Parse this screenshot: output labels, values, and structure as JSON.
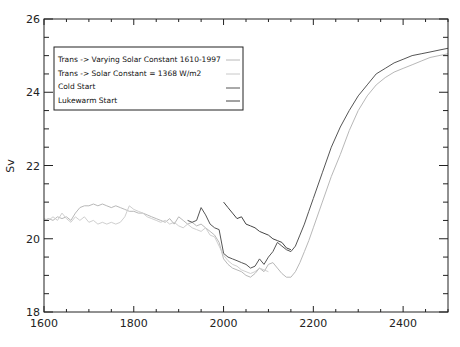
{
  "chart_data": {
    "type": "line",
    "title": "",
    "xlabel": "",
    "ylabel": "Sv",
    "xlim": [
      1600,
      2500
    ],
    "ylim": [
      18,
      26
    ],
    "x_ticks": [
      1600,
      1800,
      2000,
      2200,
      2400
    ],
    "x_tick_labels": [
      "1600",
      "1800",
      "2000",
      "2200",
      "2400"
    ],
    "x_minor_step": 50,
    "y_ticks": [
      18,
      20,
      22,
      24,
      26
    ],
    "y_tick_labels": [
      "18",
      "20",
      "22",
      "24",
      "26"
    ],
    "y_minor_step": 0.5,
    "grid": false,
    "legend_position": "upper-left",
    "series": [
      {
        "name": "Trans -> Varying Solar Constant 1610-1997",
        "color": "#b8b8b8",
        "x": [
          1600,
          1610,
          1620,
          1630,
          1640,
          1650,
          1660,
          1670,
          1680,
          1690,
          1700,
          1710,
          1720,
          1730,
          1740,
          1750,
          1760,
          1770,
          1780,
          1790,
          1800,
          1810,
          1820,
          1830,
          1840,
          1850,
          1860,
          1870,
          1880,
          1890,
          1900,
          1910,
          1920,
          1930,
          1940,
          1950,
          1960,
          1970,
          1980,
          1990,
          2000,
          2010,
          2020,
          2030,
          2040,
          2050,
          2060,
          2070,
          2080,
          2090,
          2100,
          2110,
          2120,
          2130,
          2140,
          2150,
          2160,
          2170,
          2180,
          2190,
          2200,
          2220,
          2240,
          2260,
          2280,
          2300,
          2320,
          2340,
          2360,
          2380,
          2400,
          2420,
          2440,
          2460,
          2480,
          2500
        ],
        "y": [
          20.5,
          20.55,
          20.5,
          20.6,
          20.55,
          20.6,
          20.5,
          20.7,
          20.85,
          20.9,
          20.9,
          20.95,
          20.9,
          20.95,
          20.9,
          20.85,
          20.9,
          20.85,
          20.8,
          20.75,
          20.75,
          20.7,
          20.7,
          20.65,
          20.6,
          20.55,
          20.5,
          20.45,
          20.55,
          20.4,
          20.6,
          20.5,
          20.4,
          20.45,
          20.35,
          20.4,
          20.3,
          20.2,
          20.1,
          19.9,
          19.45,
          19.3,
          19.2,
          19.15,
          19.1,
          19.0,
          18.95,
          19.05,
          19.2,
          19.1,
          19.3,
          19.35,
          19.2,
          19.05,
          18.95,
          18.95,
          19.1,
          19.35,
          19.65,
          19.95,
          20.3,
          21.0,
          21.7,
          22.3,
          22.95,
          23.5,
          23.9,
          24.2,
          24.4,
          24.55,
          24.65,
          24.75,
          24.85,
          24.95,
          25.0,
          25.05
        ]
      },
      {
        "name": "Trans -> Solar Constant = 1368 W/m^2",
        "color": "#cfcfcf",
        "x": [
          1600,
          1610,
          1620,
          1630,
          1640,
          1650,
          1660,
          1670,
          1680,
          1690,
          1700,
          1710,
          1720,
          1730,
          1740,
          1750,
          1760,
          1770,
          1780,
          1790,
          1800,
          1810,
          1820,
          1830,
          1840,
          1850,
          1860,
          1870,
          1880,
          1890,
          1900,
          1910,
          1920,
          1930,
          1940,
          1950,
          1960,
          1970,
          1980,
          1990,
          2000,
          2010,
          2020,
          2030,
          2040,
          2050,
          2060,
          2070,
          2080,
          2090,
          2100
        ],
        "y": [
          20.55,
          20.5,
          20.6,
          20.5,
          20.7,
          20.55,
          20.45,
          20.6,
          20.5,
          20.6,
          20.45,
          20.5,
          20.4,
          20.45,
          20.4,
          20.45,
          20.4,
          20.45,
          20.6,
          20.9,
          20.8,
          20.75,
          20.7,
          20.6,
          20.55,
          20.5,
          20.45,
          20.5,
          20.4,
          20.45,
          20.35,
          20.3,
          20.4,
          20.3,
          20.25,
          20.2,
          20.3,
          20.1,
          20.05,
          19.8,
          19.55,
          19.4,
          19.3,
          19.25,
          19.15,
          19.1,
          19.05,
          19.1,
          19.2,
          19.15,
          19.1
        ]
      },
      {
        "name": "Cold Start",
        "color": "#555555",
        "x": [
          1920,
          1930,
          1940,
          1950,
          1960,
          1970,
          1980,
          1990,
          2000,
          2010,
          2020,
          2030,
          2040,
          2050,
          2060,
          2070,
          2080,
          2090,
          2100,
          2110,
          2120,
          2130,
          2140,
          2150,
          2160,
          2170,
          2180,
          2190,
          2200,
          2220,
          2240,
          2260,
          2280,
          2300,
          2320,
          2340,
          2360,
          2380,
          2400,
          2420,
          2440,
          2460,
          2480,
          2500
        ],
        "y": [
          20.5,
          20.45,
          20.5,
          20.85,
          20.65,
          20.4,
          20.3,
          20.25,
          19.6,
          19.5,
          19.45,
          19.4,
          19.35,
          19.3,
          19.2,
          19.25,
          19.45,
          19.3,
          19.5,
          19.65,
          19.9,
          19.8,
          19.7,
          19.65,
          19.8,
          20.1,
          20.4,
          20.75,
          21.1,
          21.8,
          22.5,
          23.05,
          23.5,
          23.9,
          24.2,
          24.5,
          24.65,
          24.8,
          24.9,
          25.0,
          25.05,
          25.1,
          25.15,
          25.2
        ]
      },
      {
        "name": "Lukewarm Start",
        "color": "#444444",
        "x": [
          2000,
          2010,
          2020,
          2030,
          2040,
          2050,
          2060,
          2070,
          2080,
          2090,
          2100,
          2110,
          2120,
          2130,
          2140,
          2150
        ],
        "y": [
          21.0,
          20.85,
          20.7,
          20.55,
          20.6,
          20.4,
          20.35,
          20.3,
          20.2,
          20.15,
          20.1,
          20.0,
          19.95,
          19.9,
          19.75,
          19.7
        ]
      }
    ]
  },
  "legend": {
    "items": [
      {
        "label": "Trans -> Varying Solar Constant 1610-1997",
        "color": "#b8b8b8"
      },
      {
        "label": "Trans -> Solar Constant = 1368 W/m2",
        "color": "#c8c8c8"
      },
      {
        "label": "Cold Start",
        "color": "#555555"
      },
      {
        "label": "Lukewarm Start",
        "color": "#444444"
      }
    ]
  },
  "caption": {
    "text": ""
  }
}
